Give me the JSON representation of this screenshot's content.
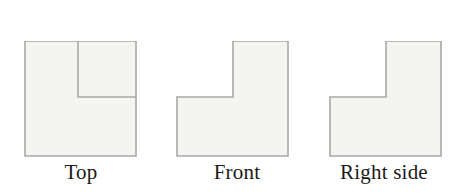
{
  "figure": {
    "background_color": "#ffffff",
    "shape_fill": "#f4f4f3",
    "shape_stroke": "#a8a8a6",
    "divider_stroke": "#a8a8a6",
    "stroke_width": 1.6,
    "caption_color": "#1a1a1a",
    "views": [
      {
        "id": "top",
        "label": "Top",
        "shape_type": "square-with-internal-divider",
        "outline_points": "25,41 136,41 136,156 25,156",
        "divider_points": "78,41 78,97 136,97",
        "bounds": {
          "x": 25,
          "y": 41,
          "width": 111,
          "height": 115
        }
      },
      {
        "id": "front",
        "label": "Front",
        "shape_type": "l-shape-notch-top-left",
        "outline_points": "233,41 288,41 288,156 177,156 177,97 233,97",
        "divider_points": "",
        "bounds": {
          "x": 177,
          "y": 41,
          "width": 111,
          "height": 115
        }
      },
      {
        "id": "right",
        "label": "Right side",
        "shape_type": "l-shape-notch-top-left",
        "outline_points": "386,41 441,41 441,156 330,156 330,97 386,97",
        "divider_points": "",
        "bounds": {
          "x": 330,
          "y": 41,
          "width": 111,
          "height": 115
        }
      }
    ]
  }
}
